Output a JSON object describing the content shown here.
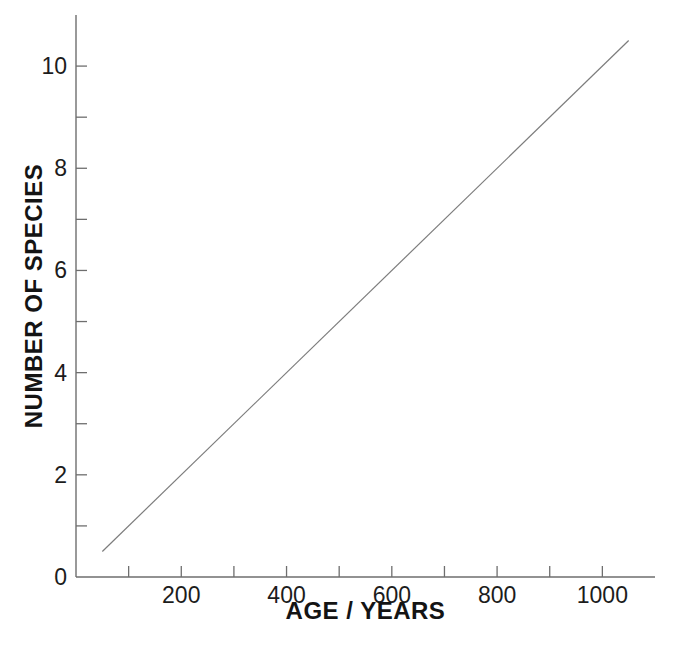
{
  "figure": {
    "background": "#ffffff",
    "axis_color": "#6e6e6e",
    "tick_color": "#6e6e6e",
    "line_color": "#7c7c7c",
    "text_color": "#1c1c1c"
  },
  "chart_data": {
    "type": "line",
    "title": "",
    "xlabel": "AGE / YEARS",
    "ylabel": "NUMBER OF SPECIES",
    "xlim": [
      0,
      1100
    ],
    "ylim": [
      0,
      11
    ],
    "grid": false,
    "legend": null,
    "x_ticks": [
      100,
      200,
      300,
      400,
      500,
      600,
      700,
      800,
      900,
      1000
    ],
    "x_labeled_ticks": [
      200,
      400,
      600,
      800,
      1000
    ],
    "y_ticks": [
      1,
      2,
      3,
      4,
      5,
      6,
      7,
      8,
      9,
      10
    ],
    "y_labeled_ticks": [
      2,
      4,
      6,
      8,
      10
    ],
    "y_origin_label": "0",
    "series": [
      {
        "name": "species-vs-age-line",
        "x": [
          50,
          1050
        ],
        "y": [
          0.5,
          10.5
        ]
      }
    ]
  }
}
